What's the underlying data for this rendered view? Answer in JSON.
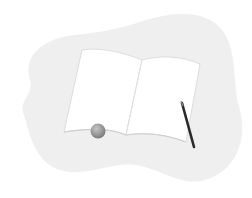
{
  "illustration": {
    "subject": "open-notebook-with-pencil",
    "colors": {
      "background": "#ffffff",
      "blob": "#efefef",
      "page": "#ffffff",
      "page_edge": "#d6d6d6",
      "spine": "#e2e2e2",
      "pencil": "#2a2a2a",
      "ball": "#9a9a9a"
    }
  }
}
